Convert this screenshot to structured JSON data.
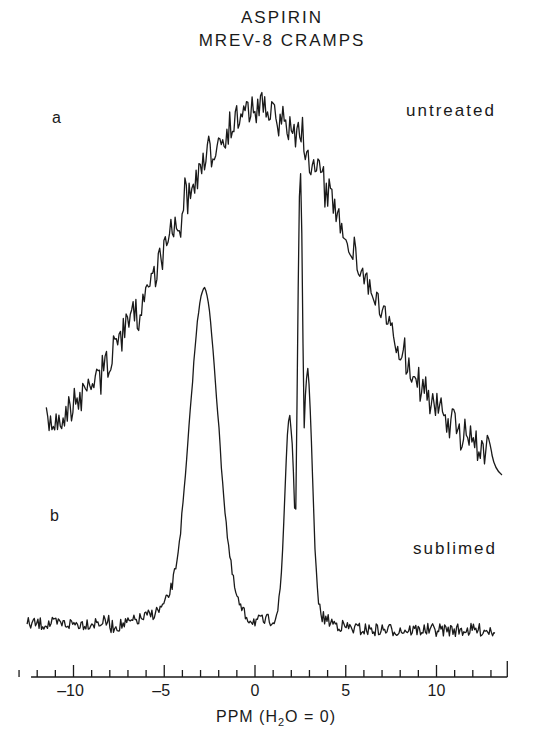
{
  "chart_data": {
    "type": "line",
    "title": "ASPIRIN",
    "subtitle": "MREV-8 CRAMPS",
    "xlabel": "PPM (H2O = 0)",
    "xlabel_parts": {
      "pre": "PPM (H",
      "sub": "2",
      "post": "O = 0)"
    },
    "ylabel": "",
    "xlim": [
      -13,
      14
    ],
    "x_major_ticks": [
      -10,
      -5,
      0,
      5,
      10
    ],
    "x_tick_labels": [
      "-10",
      "-5",
      "0",
      "5",
      "10"
    ],
    "x_minor_tick_step": 1,
    "grid": false,
    "legend": null,
    "series": [
      {
        "name": "untreated",
        "panel_label": "a",
        "shape": "single broad Gaussian-like peak with heavy noise",
        "peak_ppm": 0.3,
        "fwhm_ppm": 12,
        "x_range_ppm": [
          -11.5,
          13.5
        ],
        "relative_peak_height": 1.0,
        "baseline_relative": 0.0
      },
      {
        "name": "sublimed",
        "panel_label": "b",
        "shape": "two resolved peaks on low-noise baseline",
        "peaks": [
          {
            "ppm": -2.8,
            "relative_height": 0.72,
            "fwhm_ppm": 1.8
          },
          {
            "ppm": 1.9,
            "relative_height": 0.45,
            "fwhm_ppm": 0.6
          },
          {
            "ppm": 2.5,
            "relative_height": 1.0,
            "fwhm_ppm": 0.35
          },
          {
            "ppm": 2.9,
            "relative_height": 0.55,
            "fwhm_ppm": 0.6
          }
        ],
        "x_range_ppm": [
          -13,
          13.5
        ],
        "baseline_relative": 0.0
      }
    ],
    "annotations": [
      "a",
      "untreated",
      "b",
      "sublimed"
    ]
  },
  "labels": {
    "title_line1": "ASPIRIN",
    "title_line2": "MREV-8 CRAMPS",
    "trace_a_letter": "a",
    "trace_a_name": "untreated",
    "trace_b_letter": "b",
    "trace_b_name": "sublimed"
  },
  "axis": {
    "ticks": [
      {
        "value": -10,
        "label": "-10"
      },
      {
        "value": -5,
        "label": "-5"
      },
      {
        "value": 0,
        "label": "0"
      },
      {
        "value": 5,
        "label": "5"
      },
      {
        "value": 10,
        "label": "10"
      }
    ]
  },
  "style": {
    "ink": "#1a1a1a",
    "background": "#ffffff"
  }
}
